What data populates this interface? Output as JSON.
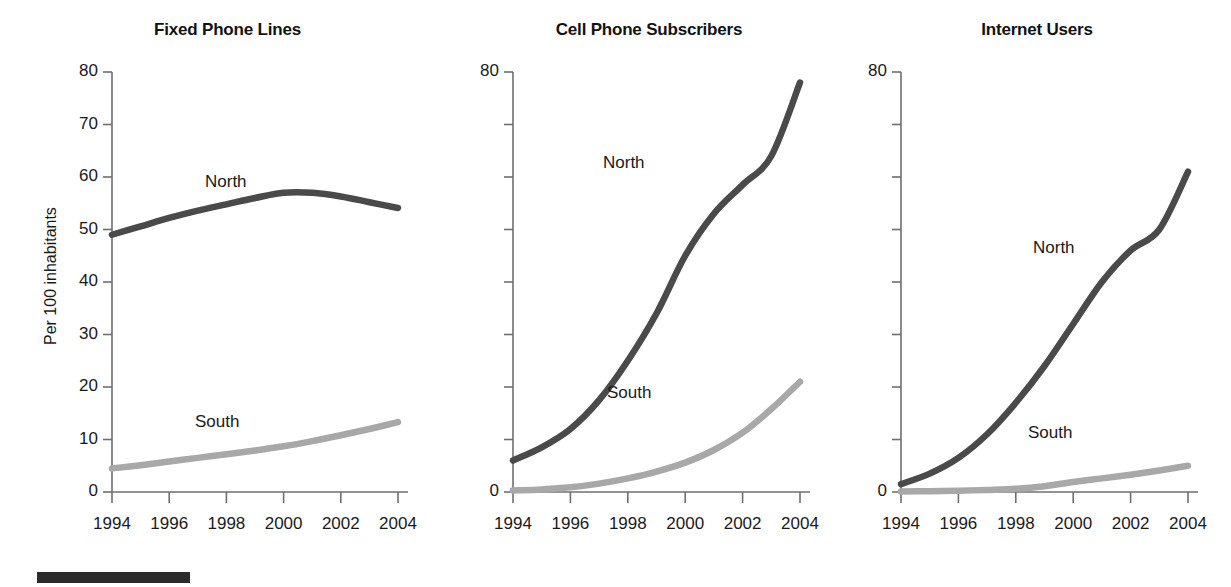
{
  "figure": {
    "y_axis_label": "Per 100 inhabitants",
    "series_names": [
      "North",
      "South"
    ],
    "colors": {
      "north": "#4a4a4a",
      "south": "#a8a8a8",
      "axis": "#6f6f6f",
      "text": "#1a1a1a",
      "footer_rule": "#2b2b2b"
    }
  },
  "chart_data": [
    {
      "type": "line",
      "title": "Fixed Phone Lines",
      "xlabel": "",
      "ylabel": "Per 100 inhabitants",
      "x": [
        1994,
        1995,
        1996,
        1997,
        1998,
        1999,
        2000,
        2001,
        2002,
        2003,
        2004
      ],
      "xtick_labels": [
        "1994",
        "1996",
        "1998",
        "2000",
        "2002",
        "2004"
      ],
      "xticks": [
        1994,
        1996,
        1998,
        2000,
        2002,
        2004
      ],
      "ytick_labels": [
        "0",
        "10",
        "20",
        "30",
        "40",
        "50",
        "60",
        "70",
        "80"
      ],
      "yticks": [
        0,
        10,
        20,
        30,
        40,
        50,
        60,
        70,
        80
      ],
      "ylim": [
        0,
        80
      ],
      "grid": false,
      "legend": "inline-labels",
      "series": [
        {
          "name": "North",
          "color": "#4a4a4a",
          "values": [
            49.0,
            50.6,
            52.2,
            53.6,
            54.8,
            56.0,
            57.0,
            57.0,
            56.3,
            55.2,
            54.1
          ]
        },
        {
          "name": "South",
          "color": "#a8a8a8",
          "values": [
            4.5,
            5.1,
            5.8,
            6.5,
            7.2,
            7.9,
            8.7,
            9.7,
            10.8,
            12.0,
            13.3
          ]
        }
      ]
    },
    {
      "type": "line",
      "title": "Cell Phone Subscribers",
      "xlabel": "",
      "ylabel": "",
      "x": [
        1994,
        1995,
        1996,
        1997,
        1998,
        1999,
        2000,
        2001,
        2002,
        2003,
        2004
      ],
      "xtick_labels": [
        "1994",
        "1996",
        "1998",
        "2000",
        "2002",
        "2004"
      ],
      "xticks": [
        1994,
        1996,
        1998,
        2000,
        2002,
        2004
      ],
      "ytick_labels": [
        "0",
        "",
        "",
        "",
        "",
        "",
        "",
        "",
        "80"
      ],
      "yticks": [
        0,
        10,
        20,
        30,
        40,
        50,
        60,
        70,
        80
      ],
      "ylim": [
        0,
        80
      ],
      "grid": false,
      "legend": "inline-labels",
      "series": [
        {
          "name": "North",
          "color": "#4a4a4a",
          "values": [
            6.0,
            8.5,
            12.0,
            17.5,
            25.0,
            34.0,
            45.0,
            53.0,
            58.5,
            64.0,
            78.0
          ]
        },
        {
          "name": "South",
          "color": "#a8a8a8",
          "values": [
            0.3,
            0.5,
            0.9,
            1.6,
            2.6,
            3.9,
            5.6,
            8.0,
            11.3,
            15.8,
            21.0
          ]
        }
      ]
    },
    {
      "type": "line",
      "title": "Internet Users",
      "xlabel": "",
      "ylabel": "",
      "x": [
        1994,
        1995,
        1996,
        1997,
        1998,
        1999,
        2000,
        2001,
        2002,
        2003,
        2004
      ],
      "xtick_labels": [
        "1994",
        "1996",
        "1998",
        "2000",
        "2002",
        "2004"
      ],
      "xticks": [
        1994,
        1996,
        1998,
        2000,
        2002,
        2004
      ],
      "ytick_labels": [
        "0",
        "",
        "",
        "",
        "",
        "",
        "",
        "",
        "80"
      ],
      "yticks": [
        0,
        10,
        20,
        30,
        40,
        50,
        60,
        70,
        80
      ],
      "ylim": [
        0,
        80
      ],
      "grid": false,
      "legend": "inline-labels",
      "series": [
        {
          "name": "North",
          "color": "#4a4a4a",
          "values": [
            1.5,
            3.5,
            6.5,
            11.0,
            17.0,
            24.0,
            32.0,
            40.0,
            46.0,
            50.0,
            61.0
          ]
        },
        {
          "name": "South",
          "color": "#a8a8a8",
          "values": [
            0.1,
            0.15,
            0.25,
            0.4,
            0.6,
            1.1,
            1.9,
            2.6,
            3.3,
            4.1,
            5.0
          ]
        }
      ]
    }
  ],
  "panels": [
    {
      "title": "Fixed Phone Lines",
      "north_label": "North",
      "south_label": "South",
      "xticks": [
        "1994",
        "1996",
        "1998",
        "2000",
        "2002",
        "2004"
      ],
      "yticks": [
        "80",
        "70",
        "60",
        "50",
        "40",
        "30",
        "20",
        "10",
        "0"
      ]
    },
    {
      "title": "Cell Phone Subscribers",
      "north_label": "North",
      "south_label": "South",
      "xticks": [
        "1994",
        "1996",
        "1998",
        "2000",
        "2002",
        "2004"
      ],
      "yticks": [
        "80",
        "0"
      ]
    },
    {
      "title": "Internet Users",
      "north_label": "North",
      "south_label": "South",
      "xticks": [
        "1994",
        "1996",
        "1998",
        "2000",
        "2002",
        "2004"
      ],
      "yticks": [
        "80",
        "0"
      ]
    }
  ]
}
